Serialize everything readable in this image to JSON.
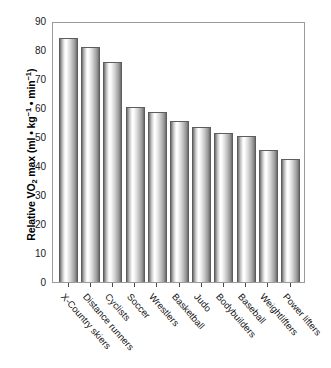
{
  "chart_data": {
    "type": "bar",
    "title": "",
    "subtitle": "",
    "xlabel": "",
    "ylabel": "Relative VO2 max (ml • kg⁻¹ • min⁻¹)",
    "ylabel_parts": {
      "lead": "Relative VO",
      "sub": "2",
      "mid": " max (ml • kg",
      "sup1": "−1",
      "mid2": " • min",
      "sup2": "−1",
      "tail": ")"
    },
    "categories": [
      "X-Country skiers",
      "Distance runners",
      "Cyclists",
      "Soccer",
      "Wrestlers",
      "Basketball",
      "Judo",
      "Bodybuilders",
      "Baseball",
      "Weightlifters",
      "Power lifters"
    ],
    "values": [
      84,
      81,
      76,
      60.5,
      58.5,
      55.5,
      53.5,
      51.5,
      50.5,
      45.5,
      42.5
    ],
    "ylim": [
      0,
      90
    ],
    "ytick_values": [
      0,
      10,
      20,
      30,
      40,
      50,
      60,
      70,
      80,
      90
    ],
    "ytick_labels": [
      "0",
      "10",
      "20",
      "30",
      "40",
      "50",
      "60",
      "70",
      "80",
      "90"
    ],
    "grid": false,
    "legend": false,
    "legend_position": "none",
    "bar_style": "cylindrical-gradient",
    "colors": {
      "bar_edge": "#5d5d5d",
      "bar_highlight": "#ffffff",
      "bar_shadow": "#636363",
      "frame": "#9a9a9a",
      "text": "#000000",
      "background": "#ffffff"
    }
  }
}
